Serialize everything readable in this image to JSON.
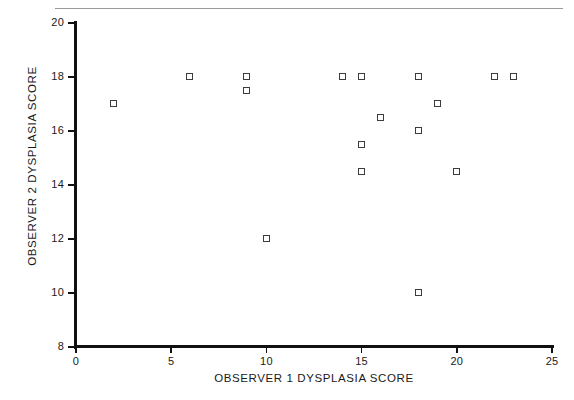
{
  "header": {
    "running_head": "",
    "rule": "horizontal-rule"
  },
  "chart_data": {
    "type": "scatter",
    "title": "",
    "xlabel": "OBSERVER 1 DYSPLASIA SCORE",
    "ylabel": "OBSERVER 2 DYSPLASIA SCORE",
    "xlim": [
      0,
      25
    ],
    "ylim": [
      8,
      20
    ],
    "xticks": [
      0,
      5,
      10,
      15,
      20,
      25
    ],
    "yticks": [
      8,
      10,
      12,
      14,
      16,
      18,
      20
    ],
    "xtick_labels": [
      "0",
      "5",
      "10",
      "15",
      "20",
      "25"
    ],
    "ytick_labels": [
      "8",
      "10",
      "12",
      "14",
      "16",
      "18",
      "20"
    ],
    "grid": false,
    "legend": null,
    "marker": "open-square",
    "marker_color": "#3c3c3c",
    "marker_fill": "#ffffff",
    "points": [
      {
        "x": 2,
        "y": 17
      },
      {
        "x": 6,
        "y": 18
      },
      {
        "x": 9,
        "y": 18
      },
      {
        "x": 9,
        "y": 17.5
      },
      {
        "x": 10,
        "y": 12
      },
      {
        "x": 14,
        "y": 18
      },
      {
        "x": 15,
        "y": 18
      },
      {
        "x": 15,
        "y": 15.5
      },
      {
        "x": 15,
        "y": 14.5
      },
      {
        "x": 16,
        "y": 16.5
      },
      {
        "x": 18,
        "y": 18
      },
      {
        "x": 18,
        "y": 16
      },
      {
        "x": 18,
        "y": 10
      },
      {
        "x": 19,
        "y": 17
      },
      {
        "x": 20,
        "y": 14.5
      },
      {
        "x": 22,
        "y": 18
      },
      {
        "x": 23,
        "y": 18
      }
    ]
  }
}
